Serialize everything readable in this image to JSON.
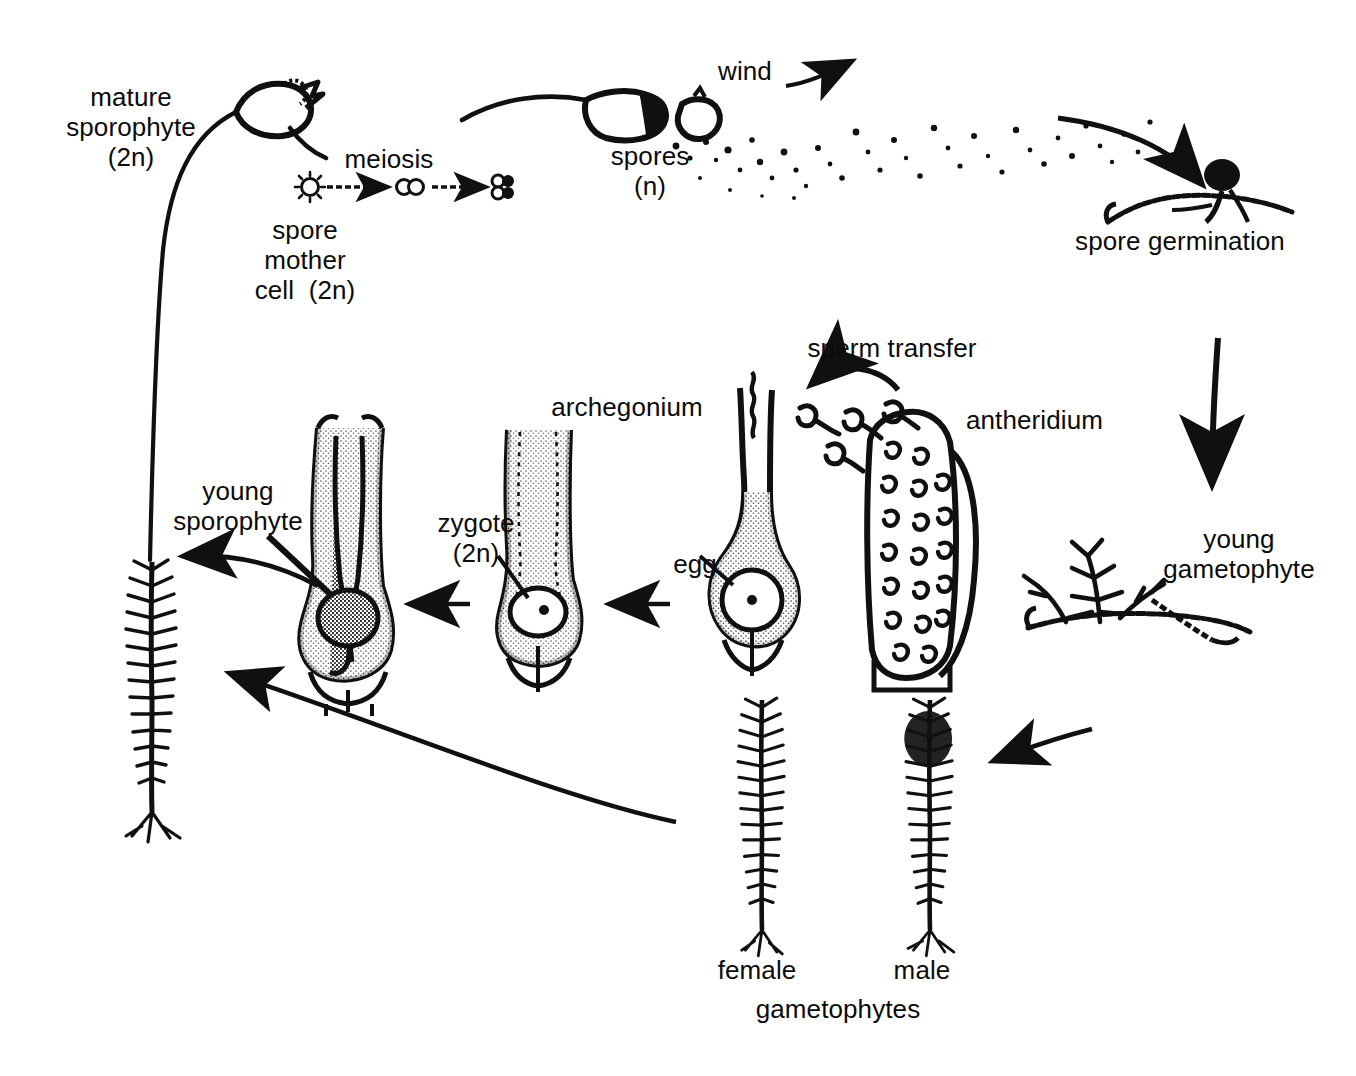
{
  "diagram": {
    "ink_color": "#101010",
    "background": "#ffffff"
  },
  "labels": {
    "mature_sporophyte": "mature\nsporophyte\n(2n)",
    "meiosis": "meiosis",
    "spore_mother_cell": "spore\nmother\ncell  (2n)",
    "wind": "wind",
    "spores": "spores\n(n)",
    "spore_germination": "spore germination",
    "young_gametophyte": "young\ngametophyte",
    "sperm_transfer": "sperm transfer",
    "archegonium": "archegonium",
    "antheridium": "antheridium",
    "zygote": "zygote\n(2n)",
    "egg": "egg",
    "young_sporophyte": "young\nsporophyte",
    "female": "female",
    "male": "male",
    "gametophytes": "gametophytes"
  },
  "stages": [
    {
      "id": "mature-sporophyte",
      "label": "mature sporophyte (2n)",
      "ploidy": "2n"
    },
    {
      "id": "spore-mother-cell",
      "label": "spore mother cell (2n)",
      "ploidy": "2n"
    },
    {
      "id": "meiosis",
      "label": "meiosis",
      "ploidy": ""
    },
    {
      "id": "spores",
      "label": "spores (n)",
      "ploidy": "n"
    },
    {
      "id": "spore-germination",
      "label": "spore germination",
      "ploidy": "n"
    },
    {
      "id": "young-gametophyte",
      "label": "young gametophyte",
      "ploidy": "n"
    },
    {
      "id": "gametophytes",
      "label": "female and male gametophytes",
      "ploidy": "n"
    },
    {
      "id": "antheridium",
      "label": "antheridium",
      "ploidy": "n"
    },
    {
      "id": "archegonium",
      "label": "archegonium",
      "ploidy": "n"
    },
    {
      "id": "sperm-transfer",
      "label": "sperm transfer",
      "ploidy": ""
    },
    {
      "id": "egg",
      "label": "egg",
      "ploidy": "n"
    },
    {
      "id": "zygote",
      "label": "zygote (2n)",
      "ploidy": "2n"
    },
    {
      "id": "young-sporophyte",
      "label": "young sporophyte",
      "ploidy": "2n"
    }
  ],
  "meiosis_sequence": [
    "1 cell",
    "2 cells",
    "4 cells (tetrad)"
  ]
}
